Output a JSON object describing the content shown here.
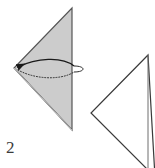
{
  "figure": {
    "step_label": "2",
    "background_color": "#ffffff"
  },
  "shapes": {
    "folded_triangle": {
      "name": "folded-paper-triangle",
      "fill_color": "#cccccc",
      "stroke_color": "#555555",
      "points": "72,8 72,130 14,68"
    },
    "folded_triangle_inner_crease": {
      "name": "crease-line",
      "stroke_color": "#bdbdbd",
      "points": "14,68 72,130"
    },
    "unfolded_triangle": {
      "name": "next-step-paper-triangle",
      "fill_color": "#ffffff",
      "stroke_color": "#3a3a3a",
      "points": "148,55 91,113 155,177"
    },
    "unfolded_triangle_edge": {
      "name": "next-step-right-edge",
      "stroke_color": "#6e6e6e",
      "points": "148,55 148,168"
    }
  },
  "annotations": {
    "fold_arrow": {
      "name": "fold-direction-arrow",
      "style": "solid",
      "stroke_color": "#1a1a1a",
      "path": "M 74,66 C 62,56 36,58 18,67",
      "arrowhead_at": "left-vertex"
    },
    "fold_return_path": {
      "name": "fold-return-dotted-path",
      "style": "dotted",
      "stroke_color": "#2b2b2b",
      "path": "M 18,70 C 36,80 62,80 74,72"
    },
    "fold_loop_end": {
      "name": "fold-loop-curve",
      "style": "solid",
      "stroke_color": "#2b2b2b",
      "path": "M 74,66 C 86,66 86,72 74,72"
    }
  },
  "colors": {
    "paper_gray": "#cccccc",
    "outline_dark": "#3a3a3a",
    "outline_medium": "#6e6e6e",
    "label_text": "#3b3b3b"
  }
}
